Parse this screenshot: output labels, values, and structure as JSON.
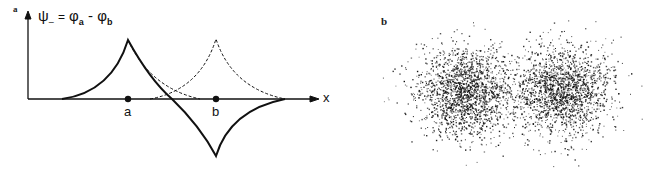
{
  "figure": {
    "panel_a": {
      "label": "a",
      "equation": "ψ₋ = φa − φb",
      "equation_parts": {
        "psi": "ψ",
        "sub": "–",
        "equals": "=",
        "phi_a": "φ",
        "a": "a",
        "minus": "-",
        "phi_b": "φ",
        "b": "b"
      },
      "x_axis_label": "x",
      "point_labels": [
        "a",
        "b"
      ],
      "description": "Antisymmetric combination of two cusp-shaped orbitals centered at a and b; solid line = ψ₋, dashed lines = individual orbitals"
    },
    "panel_b": {
      "label": "b",
      "description": "Two dot-density clouds representing electron probability distributions"
    }
  },
  "colors": {
    "ink": "#111111",
    "background": "#ffffff"
  }
}
